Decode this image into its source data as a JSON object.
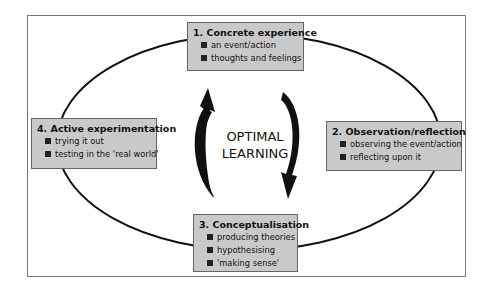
{
  "diagram": {
    "center_label": [
      "OPTIMAL",
      "LEARNING"
    ],
    "stages": [
      {
        "title": "1. Concrete experience",
        "items": [
          "an event/action",
          "thoughts and feelings"
        ]
      },
      {
        "title": "2. Observation/reflection",
        "items": [
          "observing the event/action",
          "reflecting upon it"
        ]
      },
      {
        "title": "3. Conceptualisation",
        "items": [
          "producing theories",
          "hypothesising",
          "'making sense'"
        ]
      },
      {
        "title": "4. Active experimentation",
        "items": [
          "trying it out",
          "testing in the 'real world'"
        ]
      }
    ],
    "colors": {
      "box_fill": "#c9c9c9",
      "box_border": "#666666",
      "ink": "#111111",
      "frame": "#777777"
    }
  }
}
